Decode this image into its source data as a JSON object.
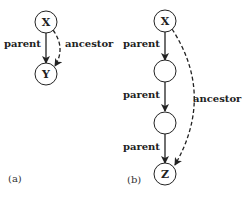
{
  "diagram_a": {
    "caption": "(a)",
    "nodes": [
      {
        "id": "x",
        "label": "X"
      },
      {
        "id": "y",
        "label": "Y"
      }
    ],
    "edges": [
      {
        "from": "X",
        "to": "Y",
        "label": "parent",
        "style": "solid"
      },
      {
        "from": "X",
        "to": "Y",
        "label": "ancestor",
        "style": "dashed"
      }
    ]
  },
  "diagram_b": {
    "caption": "(b)",
    "nodes": [
      {
        "id": "x",
        "label": "X"
      },
      {
        "id": "n1",
        "label": ""
      },
      {
        "id": "n2",
        "label": ""
      },
      {
        "id": "z",
        "label": "Z"
      }
    ],
    "edges": [
      {
        "from": "X",
        "to": "n1",
        "label": "parent",
        "style": "solid"
      },
      {
        "from": "n1",
        "to": "n2",
        "label": "parent",
        "style": "solid"
      },
      {
        "from": "n2",
        "to": "Z",
        "label": "parent",
        "style": "solid"
      },
      {
        "from": "X",
        "to": "Z",
        "label": "ancestor",
        "style": "dashed"
      }
    ]
  }
}
